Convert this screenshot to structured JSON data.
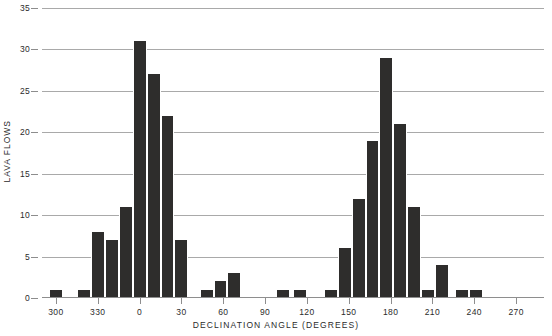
{
  "chart_data": {
    "type": "bar",
    "title": "",
    "xlabel": "DECLINATION ANGLE (DEGREES)",
    "ylabel": "LAVA FLOWS",
    "xlim": [
      290,
      290
    ],
    "ylim": [
      0,
      35
    ],
    "ytick_values": [
      0,
      5,
      10,
      15,
      20,
      25,
      30,
      35
    ],
    "ytick_labels": [
      "0",
      "5",
      "10",
      "15",
      "20",
      "25",
      "30",
      "35"
    ],
    "xtick_values": [
      300,
      330,
      0,
      30,
      60,
      90,
      120,
      150,
      180,
      210,
      240,
      270
    ],
    "xtick_labels": [
      "300",
      "330",
      "0",
      "30",
      "60",
      "90",
      "120",
      "150",
      "180",
      "210",
      "240",
      "270"
    ],
    "grid": true,
    "legend": null,
    "bin_width_degrees": 10,
    "bar_color": "#2e2d2c",
    "grid_color": "#a9a9a9",
    "axis_color": "#8e8e8e",
    "background_color": "#ffffff",
    "note": "Angles are plotted on a wrapped scale running 290 -> 360/0 -> 290. Bins are 10 degrees wide; bin_start is the left edge in plot order.",
    "bins": [
      {
        "bin_start": 295,
        "label": "295-305",
        "value": 1
      },
      {
        "bin_start": 315,
        "label": "315-325",
        "value": 1
      },
      {
        "bin_start": 325,
        "label": "325-335",
        "value": 8
      },
      {
        "bin_start": 335,
        "label": "335-345",
        "value": 7
      },
      {
        "bin_start": 345,
        "label": "345-355",
        "value": 11
      },
      {
        "bin_start": 355,
        "label": "355-005",
        "value": 31
      },
      {
        "bin_start": 5,
        "label": "005-015",
        "value": 27
      },
      {
        "bin_start": 15,
        "label": "015-025",
        "value": 22
      },
      {
        "bin_start": 25,
        "label": "025-035",
        "value": 7
      },
      {
        "bin_start": 43,
        "label": "043-053",
        "value": 1
      },
      {
        "bin_start": 53,
        "label": "053-063",
        "value": 2
      },
      {
        "bin_start": 63,
        "label": "063-073",
        "value": 3
      },
      {
        "bin_start": 98,
        "label": "098-108",
        "value": 1
      },
      {
        "bin_start": 110,
        "label": "110-120",
        "value": 1
      },
      {
        "bin_start": 132,
        "label": "132-142",
        "value": 1
      },
      {
        "bin_start": 142,
        "label": "142-152",
        "value": 6
      },
      {
        "bin_start": 152,
        "label": "152-162",
        "value": 12
      },
      {
        "bin_start": 162,
        "label": "162-172",
        "value": 19
      },
      {
        "bin_start": 172,
        "label": "172-182",
        "value": 29
      },
      {
        "bin_start": 182,
        "label": "182-192",
        "value": 21
      },
      {
        "bin_start": 192,
        "label": "192-202",
        "value": 11
      },
      {
        "bin_start": 202,
        "label": "202-212",
        "value": 1
      },
      {
        "bin_start": 212,
        "label": "212-222",
        "value": 4
      },
      {
        "bin_start": 226,
        "label": "226-236",
        "value": 1
      },
      {
        "bin_start": 236,
        "label": "236-246",
        "value": 1
      }
    ]
  }
}
